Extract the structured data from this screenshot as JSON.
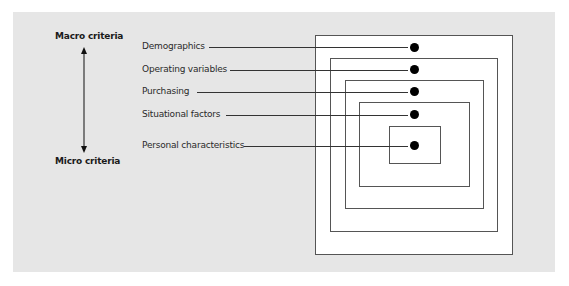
{
  "diagram": {
    "axis": {
      "top_label": "Macro criteria",
      "bottom_label": "Micro criteria"
    },
    "levels": [
      {
        "label": "Demographics"
      },
      {
        "label": "Operating variables"
      },
      {
        "label": "Purchasing"
      },
      {
        "label": "Situational factors"
      },
      {
        "label": "Personal characteristics"
      }
    ],
    "colors": {
      "panel_background": "#e6e6e6",
      "box_fill": "#ffffff",
      "box_border": "#555555",
      "dot": "#000000",
      "line": "#333333"
    }
  }
}
